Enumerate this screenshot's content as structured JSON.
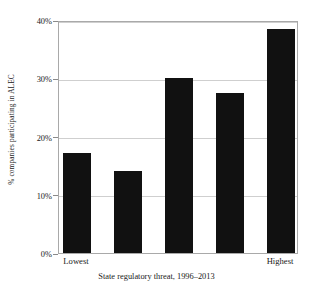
{
  "chart_data": {
    "type": "bar",
    "title": "",
    "subtitle": "",
    "xlabel": "State regulatory threat, 1996–2013",
    "ylabel": "% companies participating in ALEC",
    "categories": [
      "1",
      "2",
      "3",
      "4",
      "5"
    ],
    "category_tick_labels": [
      "Lowest",
      "",
      "",
      "",
      "Highest"
    ],
    "values": [
      17.1,
      14.1,
      30.0,
      27.5,
      38.4
    ],
    "ylim": [
      0,
      40
    ],
    "ytick_values": [
      0,
      10,
      20,
      30,
      40
    ],
    "ytick_labels": [
      "0%",
      "10%",
      "20%",
      "30%",
      "40%"
    ],
    "grid": true,
    "grid_axis": "y",
    "legend": false,
    "legend_position": "none",
    "bar_color": "#111111",
    "grid_color": "#cfcfcf",
    "axis_border_color": "#a9a9a9",
    "text_color": "#1a1a1a",
    "background_color": "#ffffff"
  },
  "axis": {
    "x_tick_lowest": "Lowest",
    "x_tick_highest": "Highest"
  }
}
